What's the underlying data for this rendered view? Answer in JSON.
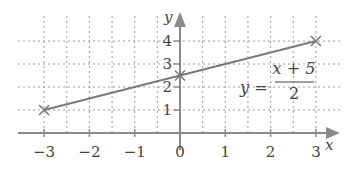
{
  "chart_data": {
    "type": "line",
    "title": "",
    "xlabel": "x",
    "ylabel": "y",
    "xlim": [
      -3,
      3
    ],
    "ylim": [
      0,
      4
    ],
    "grid": true,
    "x_ticks": [
      "−3",
      "−2",
      "−1",
      "0",
      "1",
      "2",
      "3"
    ],
    "y_ticks": [
      "1",
      "2",
      "3",
      "4"
    ],
    "series": [
      {
        "name": "y = (x + 5)/2",
        "x": [
          -3,
          0,
          3
        ],
        "y": [
          1,
          2.5,
          4
        ],
        "markers": "cross"
      }
    ],
    "annotation": {
      "lhs": "y =",
      "numerator": "x + 5",
      "denominator": "2"
    }
  },
  "colors": {
    "axis": "#8a8a8a",
    "grid": "#9a9a9a",
    "line": "#7a7a7a",
    "text": "#444444"
  }
}
